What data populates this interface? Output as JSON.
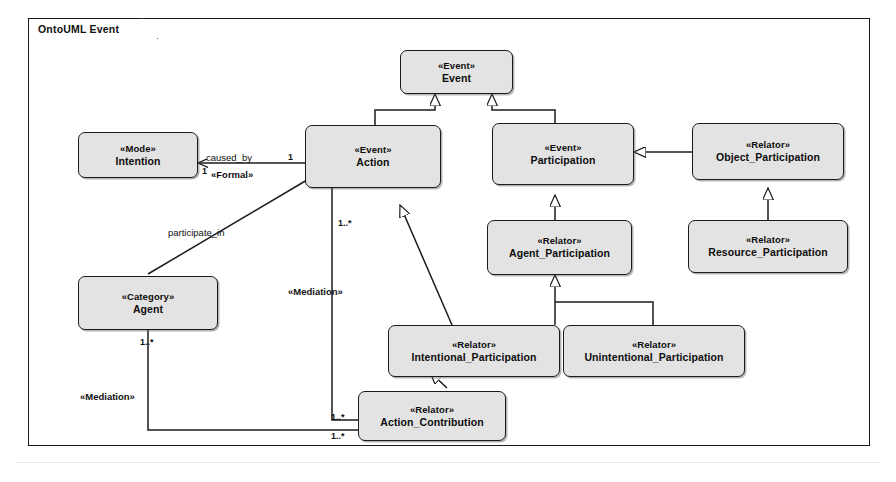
{
  "package": {
    "label": "OntoUML Event"
  },
  "classes": [
    {
      "id": "event",
      "stereotype": "«Event»",
      "name": "Event"
    },
    {
      "id": "intention",
      "stereotype": "«Mode»",
      "name": "Intention"
    },
    {
      "id": "action",
      "stereotype": "«Event»",
      "name": "Action"
    },
    {
      "id": "participation",
      "stereotype": "«Event»",
      "name": "Participation"
    },
    {
      "id": "object_part",
      "stereotype": "«Relator»",
      "name": "Object_Participation"
    },
    {
      "id": "agent_part",
      "stereotype": "«Relator»",
      "name": "Agent_Participation"
    },
    {
      "id": "resource_part",
      "stereotype": "«Relator»",
      "name": "Resource_Participation"
    },
    {
      "id": "agent",
      "stereotype": "«Category»",
      "name": "Agent"
    },
    {
      "id": "intentional",
      "stereotype": "«Relator»",
      "name": "Intentional_Participation"
    },
    {
      "id": "unintentional",
      "stereotype": "«Relator»",
      "name": "Unintentional_Participation"
    },
    {
      "id": "action_contrib",
      "stereotype": "«Relator»",
      "name": "Action_Contribution"
    }
  ],
  "labels": {
    "caused_by": "caused_by",
    "formal": "«Formal»",
    "participate_in": "participate_in",
    "mediation_1": "«Mediation»",
    "mediation_2": "«Mediation»",
    "mult_intention": "1",
    "mult_action_right": "1",
    "mult_action_bottom": "1..*",
    "mult_agent": "1..*",
    "mult_contrib_top": "1..*",
    "mult_contrib_bottom": "1..*"
  },
  "colors": {
    "box_fill": "#e3e3e3",
    "box_fill_light": "#ededed",
    "line": "#1b1b1b",
    "page_background": "#ffffff"
  }
}
